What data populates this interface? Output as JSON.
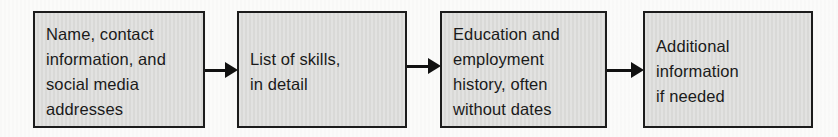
{
  "diagram": {
    "type": "flowchart",
    "direction": "left-to-right",
    "boxes": [
      {
        "label": "Name, contact\ninformation, and\nsocial media\naddresses"
      },
      {
        "label": "List of skills,\nin detail"
      },
      {
        "label": "Education and\nemployment\nhistory, often\nwithout dates"
      },
      {
        "label": "Additional\ninformation\nif needed"
      }
    ],
    "connectors": [
      {
        "from": 0,
        "to": 1,
        "style": "solid-arrow"
      },
      {
        "from": 1,
        "to": 2,
        "style": "solid-arrow"
      },
      {
        "from": 2,
        "to": 3,
        "style": "solid-arrow"
      }
    ],
    "colors": {
      "box_fill": "#dcdcda",
      "box_border": "#1c1c1c",
      "arrow": "#111111",
      "text": "#1a1a1a",
      "background": "#fbfbfa"
    }
  }
}
